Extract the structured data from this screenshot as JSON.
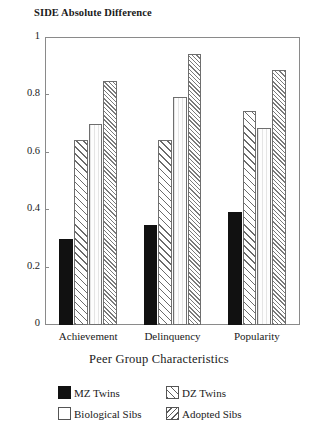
{
  "chart_data": {
    "type": "bar",
    "title": "",
    "ylabel": "SIDE Absolute Difference",
    "xlabel": "Peer Group Characteristics",
    "categories": [
      "Achievement",
      "Delinquency",
      "Popularity"
    ],
    "series": [
      {
        "name": "MZ Twins",
        "values": [
          0.3,
          0.35,
          0.395
        ],
        "fill": "solid-black",
        "color": "#111111"
      },
      {
        "name": "DZ Twins",
        "values": [
          0.645,
          0.645,
          0.745
        ],
        "fill": "diagonal-hatch",
        "color": "#6b6b6b"
      },
      {
        "name": "Biological Sibs",
        "values": [
          0.7,
          0.795,
          0.685
        ],
        "fill": "white",
        "color": "#fbfbfb"
      },
      {
        "name": "Adopted Sibs",
        "values": [
          0.85,
          0.945,
          0.89
        ],
        "fill": "dense-diagonal-hatch",
        "color": "#7a7a7a"
      }
    ],
    "ylim": [
      0,
      1
    ],
    "yticks": [
      0,
      0.2,
      0.4,
      0.6,
      0.8,
      1
    ],
    "ytick_labels": [
      "0",
      "0.2",
      "0.4",
      "0.6",
      "0.8",
      "1"
    ],
    "grid": false,
    "legend_position": "below-axis",
    "legend_entries": [
      "MZ Twins",
      "DZ Twins",
      "Biological Sibs",
      "Adopted Sibs"
    ]
  },
  "axes": {
    "y_title": "SIDE Absolute Difference",
    "x_title": "Peer Group Characteristics"
  }
}
